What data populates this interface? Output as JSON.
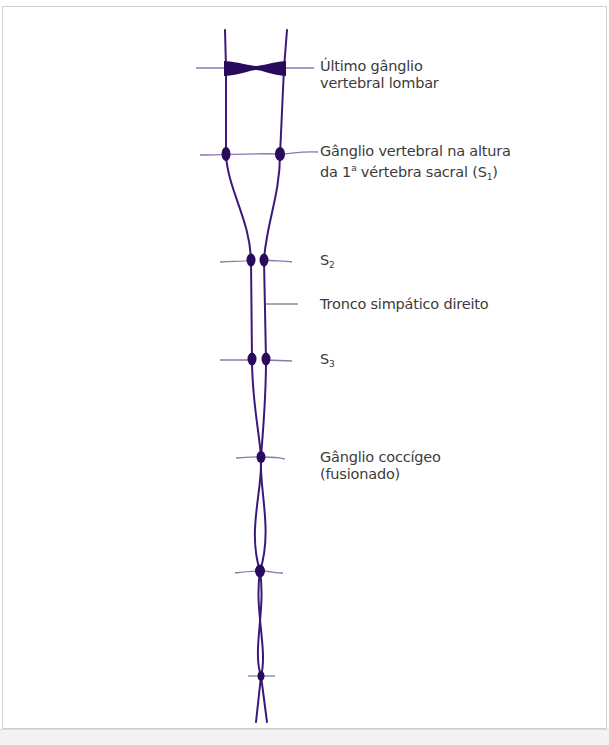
{
  "diagram": {
    "colors": {
      "nerve": "#3a1a78",
      "ganglion": "#2a0a5c",
      "branch": "#8a78b0",
      "leader": "#555555",
      "text": "#3b3b3b",
      "frame": "#cfcfcf"
    },
    "labels": {
      "lumbar": {
        "line1": "Último gânglio",
        "line2": "vertebral lombar"
      },
      "s1": {
        "line1": "Gânglio vertebral na altura",
        "line2_prefix": "da 1",
        "line2_sup": "a",
        "line2_mid": " vértebra sacral (S",
        "line2_sub": "1",
        "line2_suffix": ")"
      },
      "s2": {
        "text": "S",
        "sub": "2"
      },
      "trunk": {
        "text": "Tronco simpático direito"
      },
      "s3": {
        "text": "S",
        "sub": "3"
      },
      "coccygeal": {
        "line1": "Gânglio coccígeo",
        "line2": "(fusionado)"
      }
    },
    "nodes": [
      {
        "id": "last-lumbar",
        "y": 68
      },
      {
        "id": "s1",
        "y": 155
      },
      {
        "id": "s2",
        "y": 260
      },
      {
        "id": "s3",
        "y": 360
      },
      {
        "id": "coccygeal",
        "y": 457
      },
      {
        "id": "lower-1",
        "y": 571
      },
      {
        "id": "lower-2",
        "y": 676
      }
    ]
  }
}
